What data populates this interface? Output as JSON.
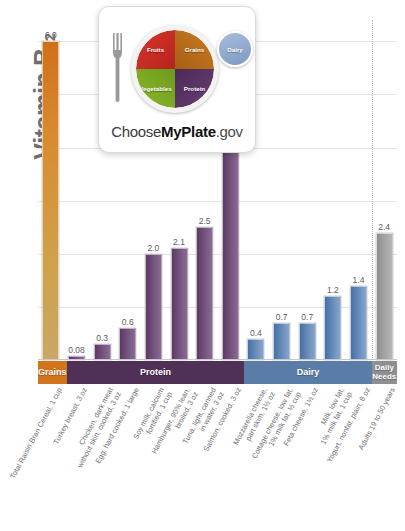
{
  "logo": {
    "name": "myplate-logo",
    "wordmark_choose": "Choose",
    "wordmark_myplate": "MyPlate",
    "wordmark_gov": ".gov",
    "segments": [
      {
        "key": "fruits",
        "label": "Fruits",
        "color": "#c62d24"
      },
      {
        "key": "grains",
        "label": "Grains",
        "color": "#b86a1b"
      },
      {
        "key": "vegetables",
        "label": "Vegetables",
        "color": "#7ca823"
      },
      {
        "key": "protein",
        "label": "Protein",
        "color": "#5a3566"
      },
      {
        "key": "dairy",
        "label": "Dairy",
        "color": "#8fa9cd"
      }
    ]
  },
  "axis": {
    "units_label": "Micrograms (µg) of",
    "main_label": "Vitamin B",
    "main_subscript": "12"
  },
  "categories_band": [
    {
      "key": "grains",
      "label": "Grains",
      "color": "#d2741c",
      "count": 1
    },
    {
      "key": "protein",
      "label": "Protein",
      "color": "#503056",
      "count": 7
    },
    {
      "key": "dairy",
      "label": "Dairy",
      "color": "#5a7da8",
      "count": 5
    },
    {
      "key": "needs",
      "label": "Daily Needs",
      "color": "#8f8f91",
      "count": 1
    }
  ],
  "chart_data": {
    "type": "bar",
    "xlabel": "",
    "ylabel": "Micrograms (µg) of Vitamin B12",
    "ylim": [
      0,
      6.4
    ],
    "grid": true,
    "legend": false,
    "gridlines": [
      1,
      2,
      3,
      4,
      5,
      6
    ],
    "categories": [
      "Total Raisin Bran Cereal, 1 cup",
      "Turkey breast, 3 oz",
      "Chicken, dark meat without skin, cooked, 3 oz",
      "Egg, hard cooked, 1 large",
      "Soy milk, calcium fortified, 1 cup",
      "Hamburger, 90% lean, broiled, 3 oz",
      "Tuna, light, canned in water, 3 oz",
      "Salmon, cooked, 3 oz",
      "Mozzarella cheese, part skim, 1½ oz",
      "Cottage cheese, low fat, 1% milk fat, ½ cup",
      "Feta cheese, 1½ oz",
      "Milk, low fat, 1% milk fat, 1 cup",
      "Yogurt, nonfat, plain, 8 oz",
      "Adults 19 to 50 years"
    ],
    "category_lines": [
      [
        "Total Raisin Bran Cereal, 1 cup"
      ],
      [
        "Turkey breast, 3 oz"
      ],
      [
        "Chicken, dark meat",
        "without skin, cooked, 3 oz"
      ],
      [
        "Egg, hard cooked, 1 large"
      ],
      [
        "Soy milk, calcium",
        "fortified, 1 cup"
      ],
      [
        "Hamburger, 90% lean,",
        "broiled, 3 oz"
      ],
      [
        "Tuna, light, canned",
        "in water, 3 oz"
      ],
      [
        "Salmon, cooked, 3 oz"
      ],
      [
        "Mozzarella cheese,",
        "part skim, 1½ oz"
      ],
      [
        "Cottage cheese, low fat,",
        "1% milk fat, ½ cup"
      ],
      [
        "Feta cheese, 1½ oz"
      ],
      [
        "Milk, low fat,",
        "1% milk fat, 1 cup"
      ],
      [
        "Yogurt, nonfat, plain, 8 oz"
      ],
      [
        "Adults 19 to 50 years"
      ]
    ],
    "values": [
      6.0,
      0.08,
      0.3,
      0.6,
      2.0,
      2.1,
      2.5,
      4.8,
      0.4,
      0.7,
      0.7,
      1.2,
      1.4,
      2.4
    ],
    "value_labels": [
      "6.0",
      "0.08",
      "0.3",
      "0.6",
      "2.0",
      "2.1",
      "2.5",
      "4.8",
      "0.4",
      "0.7",
      "0.7",
      "1.2",
      "1.4",
      "2.4"
    ],
    "groups": [
      "grains",
      "protein",
      "protein",
      "protein",
      "protein",
      "protein",
      "protein",
      "protein",
      "dairy",
      "dairy",
      "dairy",
      "dairy",
      "dairy",
      "needs"
    ],
    "group_colors": {
      "grains": "#d2741c",
      "protein": "#6d4b77",
      "dairy": "#5c83b4",
      "needs": "#9d9d9d"
    },
    "annotations": [
      {
        "type": "separator",
        "style": "dotted",
        "before_category": "Adults 19 to 50 years"
      }
    ]
  }
}
